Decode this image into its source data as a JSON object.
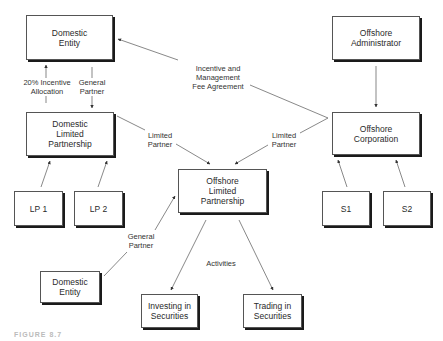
{
  "diagram": {
    "nodes": {
      "domestic_entity_top": "Domestic\nEntity",
      "domestic_lp": "Domestic\nLimited\nPartnership",
      "lp1": "LP 1",
      "lp2": "LP 2",
      "offshore_admin": "Offshore\nAdministrator",
      "offshore_corp": "Offshore\nCorporation",
      "s1": "S1",
      "s2": "S2",
      "offshore_lp": "Offshore\nLimited\nPartnership",
      "domestic_entity_bottom": "Domestic\nEntity",
      "investing": "Investing in\nSecurities",
      "trading": "Trading in\nSecurities"
    },
    "edge_labels": {
      "incentive_allocation": "20% Incentive\nAllocation",
      "general_partner_top": "General\nPartner",
      "incentive_fee": "Incentive and\nManagement\nFee Agreement",
      "limited_partner_left": "Limited\nPartner",
      "limited_partner_right": "Limited\nPartner",
      "general_partner_bottom": "General\nPartner",
      "activities": "Activities"
    },
    "caption": "FIGURE 8.7"
  }
}
